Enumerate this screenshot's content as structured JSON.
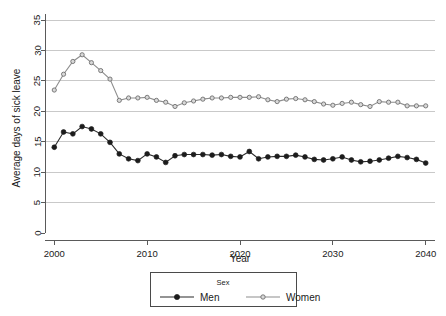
{
  "chart_data": {
    "type": "line",
    "title": "",
    "xlabel": "Year",
    "ylabel": "Average days of sick leave",
    "xlim": [
      1999,
      2041
    ],
    "ylim": [
      0,
      36
    ],
    "xticks": [
      2000,
      2010,
      2020,
      2030,
      2040
    ],
    "yticks": [
      0,
      5,
      10,
      15,
      20,
      25,
      30,
      35
    ],
    "grid": "horizontal",
    "legend_position": "bottom-outside",
    "legend_title": "Sex",
    "x": [
      2000,
      2001,
      2002,
      2003,
      2004,
      2005,
      2006,
      2007,
      2008,
      2009,
      2010,
      2011,
      2012,
      2013,
      2014,
      2015,
      2016,
      2017,
      2018,
      2019,
      2020,
      2021,
      2022,
      2023,
      2024,
      2025,
      2026,
      2027,
      2028,
      2029,
      2030,
      2031,
      2032,
      2033,
      2034,
      2035,
      2036,
      2037,
      2038,
      2039,
      2040
    ],
    "series": [
      {
        "name": "Men",
        "color": "#1c1c1c",
        "marker": "filled-circle",
        "values": [
          14.1,
          16.6,
          16.3,
          17.5,
          17.1,
          16.3,
          14.9,
          13.0,
          12.2,
          11.9,
          13.0,
          12.5,
          11.6,
          12.7,
          12.9,
          12.9,
          12.9,
          12.8,
          12.9,
          12.6,
          12.5,
          13.4,
          12.2,
          12.5,
          12.6,
          12.6,
          12.8,
          12.5,
          12.1,
          12.0,
          12.2,
          12.5,
          12.0,
          11.7,
          11.8,
          12.0,
          12.3,
          12.6,
          12.4,
          12.1,
          11.5
        ]
      },
      {
        "name": "Women",
        "color": "#8d8d8d",
        "marker": "open-circle",
        "values": [
          23.5,
          26.1,
          28.2,
          29.3,
          28.0,
          26.7,
          25.3,
          21.8,
          22.2,
          22.2,
          22.3,
          21.8,
          21.5,
          20.8,
          21.4,
          21.7,
          22.0,
          22.2,
          22.2,
          22.3,
          22.3,
          22.3,
          22.4,
          21.9,
          21.6,
          22.0,
          22.1,
          21.9,
          21.6,
          21.2,
          21.0,
          21.3,
          21.5,
          21.1,
          20.8,
          21.6,
          21.5,
          21.5,
          20.9,
          20.9,
          20.9
        ]
      }
    ]
  },
  "axes": {
    "y_title": "Average days of sick leave",
    "x_title": "Year",
    "x_tick_labels": [
      "2000",
      "2010",
      "2020",
      "2030",
      "2040"
    ],
    "y_tick_labels": [
      "0",
      "5",
      "10",
      "15",
      "20",
      "25",
      "30",
      "35"
    ]
  },
  "legend": {
    "title": "Sex",
    "entries": [
      {
        "label": "Men",
        "color": "#1c1c1c"
      },
      {
        "label": "Women",
        "color": "#8d8d8d"
      }
    ]
  }
}
